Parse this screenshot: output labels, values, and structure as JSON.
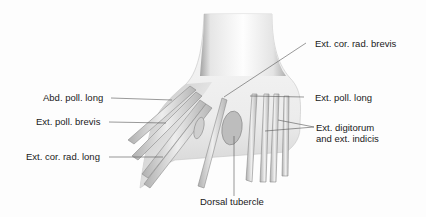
{
  "diagram": {
    "labels": {
      "abd_poll_long": "Abd. poll. long",
      "ext_poll_brevis": "Ext. poll. brevis",
      "ext_cor_rad_long": "Ext. cor. rad. long",
      "ext_cor_rad_brevis": "Ext. cor. rad. brevis",
      "ext_poll_long": "Ext. poll. long",
      "ext_digitorum_line1": "Ext. digitorum",
      "ext_digitorum_line2": "and ext. indicis",
      "dorsal_tubercle": "Dorsal tubercle"
    },
    "colors": {
      "background": "#fdfdfd",
      "bone_shade": "#c8c8c8",
      "tendon_edge": "#8a8a8a",
      "tubercle_fill": "#bdbdbd",
      "leader_line": "#555555",
      "text": "#1a1a1a"
    }
  }
}
